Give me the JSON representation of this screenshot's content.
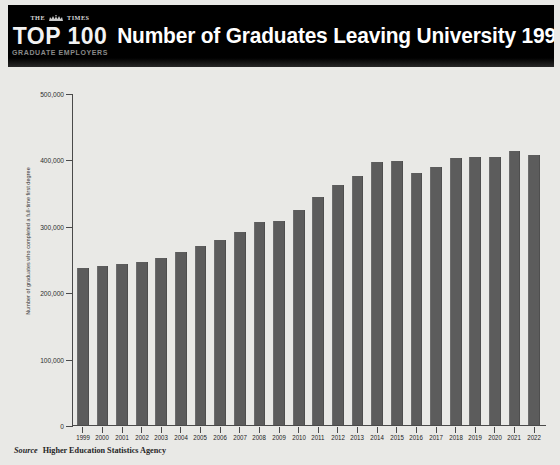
{
  "header": {
    "logo": {
      "line1": "THE",
      "line1b": "TIMES",
      "crest_icon": "royal-crest-icon",
      "line2": "TOP 100",
      "line3": "GRADUATE EMPLOYERS"
    },
    "title": "Number of Graduates Leaving University 1999-2022",
    "background_color": "#000000",
    "title_color": "#ffffff"
  },
  "footer": {
    "source_label": "Source",
    "source_value": "Higher Education Statistics Agency"
  },
  "colors": {
    "bar": "#5c5c5c",
    "plot_background": "#e9e9e6",
    "axis": "#4a4a4a"
  },
  "chart_data": {
    "type": "bar",
    "title": "Number of Graduates Leaving University 1999-2022",
    "xlabel": "",
    "ylabel": "Number of graduates who completed a full-time first degree",
    "ylim": [
      0,
      500000
    ],
    "ytick_values": [
      0,
      100000,
      200000,
      300000,
      400000,
      500000
    ],
    "ytick_labels": [
      "0",
      "100,000",
      "200,000",
      "300,000",
      "400,000",
      "500,000"
    ],
    "grid": false,
    "legend": "none",
    "source": "Higher Education Statistics Agency",
    "categories": [
      "1999",
      "2000",
      "2001",
      "2002",
      "2003",
      "2004",
      "2005",
      "2006",
      "2007",
      "2008",
      "2009",
      "2010",
      "2011",
      "2012",
      "2013",
      "2014",
      "2015",
      "2016",
      "2017",
      "2018",
      "2019",
      "2020",
      "2021",
      "2022"
    ],
    "values": [
      237000,
      240000,
      243000,
      245000,
      251000,
      261000,
      270000,
      278000,
      291000,
      305000,
      308000,
      324000,
      343000,
      362000,
      375000,
      396000,
      397000,
      379000,
      388000,
      402000,
      403000,
      403000,
      413000,
      407000
    ]
  }
}
